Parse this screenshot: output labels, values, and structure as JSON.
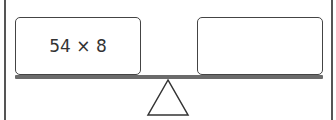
{
  "balance": {
    "left_pan": {
      "expression": "54 × 8"
    },
    "right_pan": {
      "expression": ""
    }
  },
  "colors": {
    "stroke": "#444444",
    "beam": "#6b6b6b",
    "background": "#ffffff"
  }
}
